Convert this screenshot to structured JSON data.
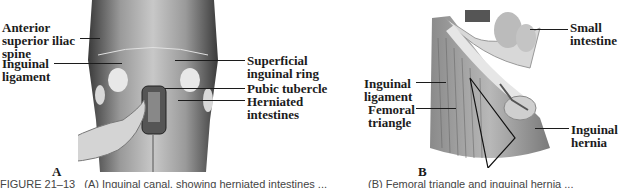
{
  "figure": {
    "panel_a": {
      "letter": "A",
      "labels": {
        "asis": [
          "Anterior",
          "superior iliac",
          "spine"
        ],
        "inguinal_ligament": [
          "Inguinal",
          "ligament"
        ],
        "superficial_ring": [
          "Superficial",
          "inguinal ring"
        ],
        "pubic_tubercle": [
          "Pubic tubercle"
        ],
        "herniated": [
          "Herniated",
          "intestines"
        ]
      }
    },
    "panel_b": {
      "letter": "B",
      "labels": {
        "small_intestine": [
          "Small",
          "intestine"
        ],
        "inguinal_ligament": [
          "Inguinal",
          "ligament"
        ],
        "femoral_triangle": [
          "Femoral",
          "triangle"
        ],
        "inguinal_hernia": [
          "Inguinal",
          "hernia"
        ]
      }
    },
    "caption": {
      "figure_number": "FIGURE 21–13",
      "part_a": "(A) Inguinal canal, showing herniated intestines ...",
      "part_b": "(B) Femoral triangle and inguinal hernia ..."
    }
  }
}
